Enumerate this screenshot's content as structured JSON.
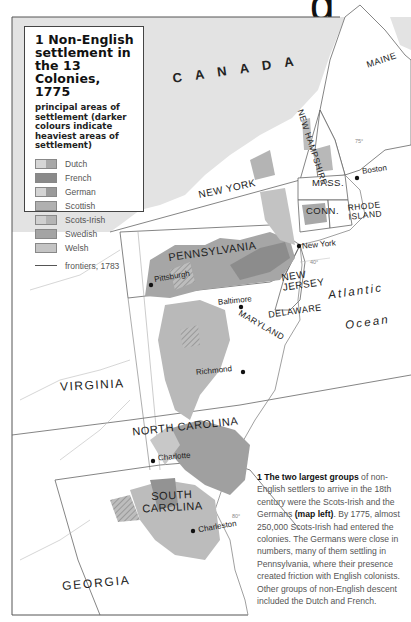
{
  "header": {
    "partial_title_glyph": "g"
  },
  "legend": {
    "number": "1",
    "title": "1 Non-English settlement in the 13 Colonies, 1775",
    "subtitle": "principal areas of settlement (darker colours indicate heaviest areas of settlement)",
    "items": [
      {
        "label": "Dutch",
        "color_light": "#d6d6d6",
        "color_dark": "#a8a8a8"
      },
      {
        "label": "French",
        "color_light": "#8a8a8a",
        "color_dark": "#8a8a8a"
      },
      {
        "label": "German",
        "color_light": "#d4d4d4",
        "color_dark": "#9a9a9a"
      },
      {
        "label": "Scottish",
        "color_light": "#b0b0b0",
        "color_dark": "#b0b0b0"
      },
      {
        "label": "Scots-Irish",
        "color_light": "#d0d0d0",
        "color_dark": "#b4b4b4"
      },
      {
        "label": "Swedish",
        "color_light": "#a4a4a4",
        "color_dark": "#a4a4a4"
      },
      {
        "label": "Welsh",
        "color_light": "#c4c4c4",
        "color_dark": "#c4c4c4"
      }
    ],
    "frontier_label": "frontiers, 1783"
  },
  "map": {
    "regions": [
      "CANADA",
      "MAINE",
      "NEW HAMPSHIRE",
      "MASS.",
      "CONN.",
      "RHODE ISLAND",
      "NEW YORK",
      "PENNSYLVANIA",
      "NEW JERSEY",
      "DELAWARE",
      "MARYLAND",
      "VIRGINIA",
      "NORTH CAROLINA",
      "SOUTH CAROLINA",
      "GEORGIA"
    ],
    "labels": {
      "canada": "C A N A D A",
      "maine": "MAINE",
      "new_hampshire": "NEW HAMPSHIRE",
      "mass": "MASS.",
      "conn": "CONN.",
      "rhode_island_1": "RHODE",
      "rhode_island_2": "ISLAND",
      "new_york": "NEW YORK",
      "pennsylvania": "PENNSYLVANIA",
      "new_jersey_1": "NEW",
      "new_jersey_2": "JERSEY",
      "delaware": "DELAWARE",
      "maryland": "MARYLAND",
      "virginia": "VIRGINIA",
      "north_carolina": "NORTH CAROLINA",
      "south_carolina_1": "SOUTH",
      "south_carolina_2": "CAROLINA",
      "georgia": "GEORGIA",
      "atlantic": "Atlantic",
      "ocean": "Ocean"
    },
    "cities": {
      "boston": "Boston",
      "new_york": "New York",
      "pittsburgh": "Pittsburgh",
      "baltimore": "Baltimore",
      "richmond": "Richmond",
      "charlotte": "Charlotte",
      "charleston": "Charleston"
    },
    "graticule": {
      "lon_75": "75°",
      "lat_40": "40°",
      "lon_80": "80°"
    }
  },
  "caption": {
    "lead": "1 The two largest groups",
    "text1": " of non-English settlers to arrive in the 18th century were the Scots-Irish and the Germans ",
    "ref": "(map left)",
    "text2": ". By 1775, almost 250,000 Scots-Irish had entered the colonies. The Germans were close in numbers, many of them settling in Pennsylvania, where their presence created friction with English colonists. Other groups of non-English descent included the Dutch and French."
  }
}
